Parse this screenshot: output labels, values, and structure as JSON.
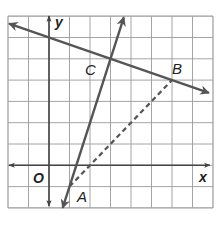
{
  "diagram": {
    "type": "coordinate-plane",
    "grid": {
      "x_min": -2,
      "x_max": 8,
      "y_min": -2,
      "y_max": 7,
      "spacing_x_px": 20.5,
      "spacing_y_px": 21.3,
      "origin_px": [
        49,
        165.3
      ]
    },
    "axis_labels": {
      "x": "x",
      "y": "y",
      "origin": "O"
    },
    "points": [
      {
        "label": "A",
        "x": 1,
        "y": -1
      },
      {
        "label": "B",
        "x": 6,
        "y": 4
      },
      {
        "label": "C",
        "x": 3,
        "y": 5
      }
    ],
    "lines": [
      {
        "name": "line-CB",
        "through": [
          "C",
          "B"
        ],
        "slope": -0.3333,
        "style": "solid",
        "arrows": "both"
      },
      {
        "name": "line-AC",
        "through": [
          "A",
          "C"
        ],
        "slope": 3,
        "style": "solid",
        "arrows": "both"
      },
      {
        "name": "segment-AB",
        "through": [
          "A",
          "B"
        ],
        "slope": 1,
        "style": "dashed",
        "arrows": "none"
      }
    ],
    "colors": {
      "grid": "#9a9a9a",
      "line": "#555555",
      "axis": "#444444",
      "label": "#222222"
    }
  }
}
